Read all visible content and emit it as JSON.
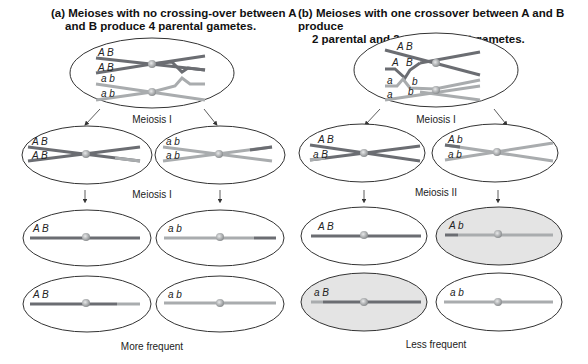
{
  "panel_a": {
    "title_line1": "(a) Meioses with no crossing-over between A",
    "title_line2": "and B produce 4 parental gametes.",
    "stage1_label": "Meiosis I",
    "stage2_label": "Meiosis I",
    "footer": "More frequent",
    "top_cell_labels": [
      "A B",
      "A B",
      "a b",
      "a b"
    ],
    "meiosis1_cells": [
      [
        "A B",
        "A B"
      ],
      [
        "a b",
        "a b"
      ]
    ],
    "gametes": [
      "A B",
      "a b",
      "A B",
      "a b"
    ]
  },
  "panel_b": {
    "title_line1": "(b) Meioses with one crossover between A and B produce",
    "title_line2": "2 parental and 2 recombinant gametes.",
    "stage1_label": "Meiosis I",
    "stage2_label": "Meiosis II",
    "footer": "Less frequent",
    "top_cell_labels": [
      "A B",
      "A",
      "B",
      "a",
      "b",
      "a",
      "b"
    ],
    "meiosis1_cells": [
      [
        "A B",
        "a B"
      ],
      [
        "A  b",
        "a  b"
      ]
    ],
    "gametes": [
      "A B",
      "A  b",
      "a  B",
      "a b"
    ],
    "recombinant_highlight": "#e4e4e4"
  },
  "colors": {
    "dark_chromatid": "#6b6d72",
    "light_chromatid": "#a9acae",
    "centromere": "#b8bbbc",
    "outline": "#333333"
  }
}
